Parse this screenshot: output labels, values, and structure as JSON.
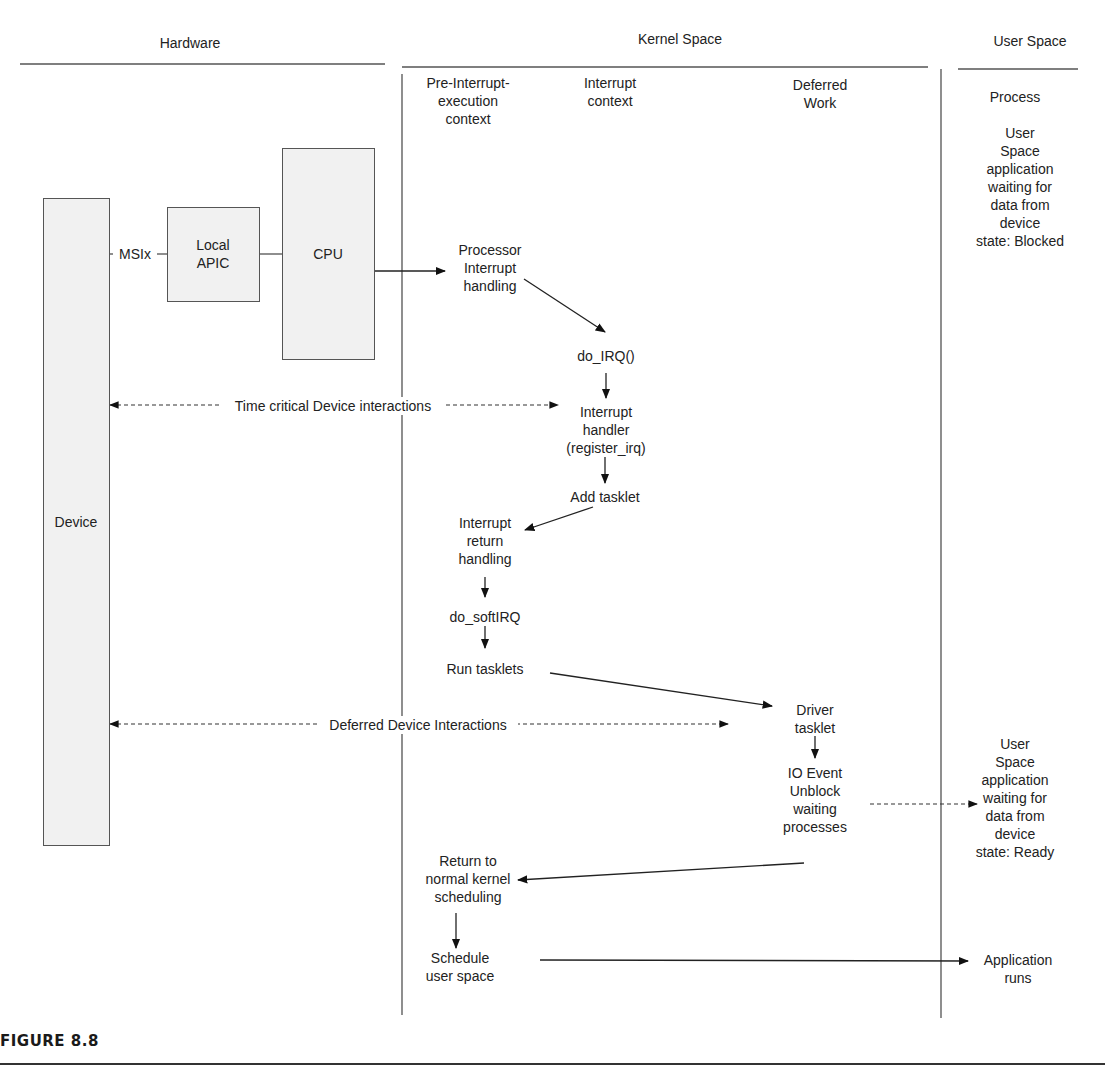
{
  "columns": {
    "hardware": "Hardware",
    "kernel": "Kernel Space",
    "user": "User Space"
  },
  "subcolumns": {
    "pre_interrupt": "Pre-Interrupt-\nexecution\ncontext",
    "interrupt": "Interrupt\ncontext",
    "deferred": "Deferred\nWork",
    "process": "Process"
  },
  "hardware": {
    "device": "Device",
    "msix": "MSIx",
    "local_apic": "Local\nAPIC",
    "cpu": "CPU"
  },
  "nodes": {
    "processor_interrupt": "Processor\nInterrupt\nhandling",
    "do_irq": "do_IRQ()",
    "interrupt_handler": "Interrupt\nhandler\n(register_irq)",
    "add_tasklet": "Add tasklet",
    "interrupt_return": "Interrupt\nreturn\nhandling",
    "do_softirq": "do_softIRQ",
    "run_tasklets": "Run tasklets",
    "driver_tasklet": "Driver\ntasklet",
    "io_event": "IO Event\nUnblock\nwaiting\nprocesses",
    "return_normal": "Return to\nnormal kernel\nscheduling",
    "schedule_user": "Schedule\nuser space"
  },
  "user_states": {
    "blocked": "User\nSpace\napplication\nwaiting for\ndata from\ndevice\nstate: Blocked",
    "ready": "User\nSpace\napplication\nwaiting for\ndata from\ndevice\nstate: Ready",
    "runs": "Application\nruns"
  },
  "interactions": {
    "time_critical": "Time critical Device interactions",
    "deferred": "Deferred Device Interactions"
  },
  "caption": "FIGURE 8.8"
}
